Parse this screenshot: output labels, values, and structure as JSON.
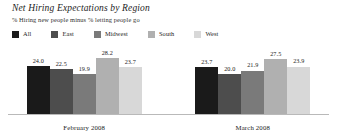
{
  "chart_data": {
    "type": "bar",
    "title": "Net Hiring Expectations by Region",
    "subtitle": "% Hiring new people minus % letting people go",
    "xlabel": "",
    "ylabel": "",
    "ylim": [
      0,
      30
    ],
    "grid": false,
    "legend_position": "top-left",
    "categories": [
      "February 2008",
      "March 2008"
    ],
    "series": [
      {
        "name": "All",
        "color": "#1a1a1a",
        "values": [
          24.0,
          23.7
        ]
      },
      {
        "name": "East",
        "color": "#4d4d4d",
        "values": [
          22.5,
          20.0
        ]
      },
      {
        "name": "Midwest",
        "color": "#7a7a7a",
        "values": [
          19.9,
          21.9
        ]
      },
      {
        "name": "South",
        "color": "#b0b0b0",
        "values": [
          28.2,
          27.5
        ]
      },
      {
        "name": "West",
        "color": "#d8d8d8",
        "values": [
          23.7,
          23.9
        ]
      }
    ],
    "value_labels": {
      "February 2008": [
        "24.0",
        "22.5",
        "19.9",
        "28.2",
        "23.7"
      ],
      "March 2008": [
        "23.7",
        "20.0",
        "21.9",
        "27.5",
        "23.9"
      ]
    }
  }
}
